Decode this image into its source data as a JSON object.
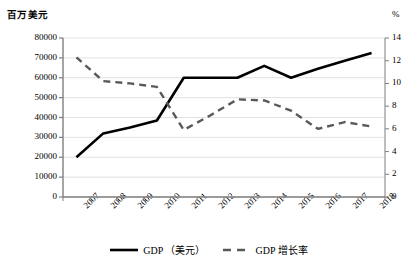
{
  "chart_data": {
    "type": "line",
    "title": "",
    "xlabel": "",
    "ylabel": "百万美元",
    "y2label": "%",
    "grid": true,
    "legend_position": "bottom",
    "categories": [
      "2007",
      "2008",
      "2009",
      "2010",
      "2011",
      "2012",
      "2013",
      "2014",
      "2015",
      "2016",
      "2017",
      "2018"
    ],
    "ylim": [
      0,
      80000
    ],
    "yticks": [
      "0",
      "10000",
      "20000",
      "30000",
      "40000",
      "50000",
      "60000",
      "70000",
      "80000"
    ],
    "y2lim": [
      0,
      14
    ],
    "y2ticks": [
      "0",
      "2",
      "4",
      "6",
      "8",
      "10",
      "12",
      "14"
    ],
    "series": [
      {
        "name": "GDP （美元）",
        "axis": "left",
        "style": "solid",
        "color": "#000000",
        "values": [
          20000,
          32000,
          35000,
          38500,
          60000,
          60000,
          60000,
          66000,
          60000,
          64500,
          68500,
          72500
        ]
      },
      {
        "name": "GDP 增长率",
        "axis": "right",
        "style": "dashed",
        "color": "#595959",
        "values": [
          12.3,
          10.2,
          10.0,
          9.7,
          5.9,
          7.2,
          8.6,
          8.5,
          7.6,
          6.0,
          6.6,
          6.2
        ]
      }
    ]
  },
  "legend": {
    "items": [
      {
        "label": "GDP （美元）",
        "style": "solid",
        "color": "#000000"
      },
      {
        "label": "GDP 增长率",
        "style": "dashed",
        "color": "#595959"
      }
    ]
  }
}
